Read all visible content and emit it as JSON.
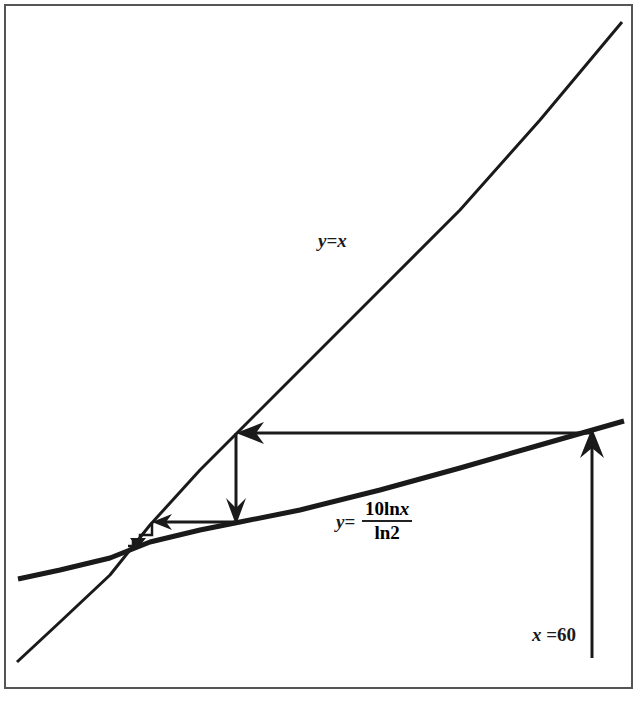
{
  "diagram": {
    "type": "cobweb-iteration",
    "frame": {
      "border_color": "#555555"
    },
    "curves": [
      {
        "name": "identity-line",
        "label": "y=x",
        "label_lhs": "y",
        "label_eq": "=",
        "label_rhs": "x"
      },
      {
        "name": "log-curve",
        "label": "y = 10 ln x / ln2",
        "label_lhs": "y",
        "label_eq": "=",
        "numerator": "10ln",
        "numerator_var": "x",
        "denominator": "ln2"
      }
    ],
    "start_label": {
      "var": "x",
      "eq": " =",
      "value": "60"
    },
    "line_color": "#1a1a1a"
  }
}
